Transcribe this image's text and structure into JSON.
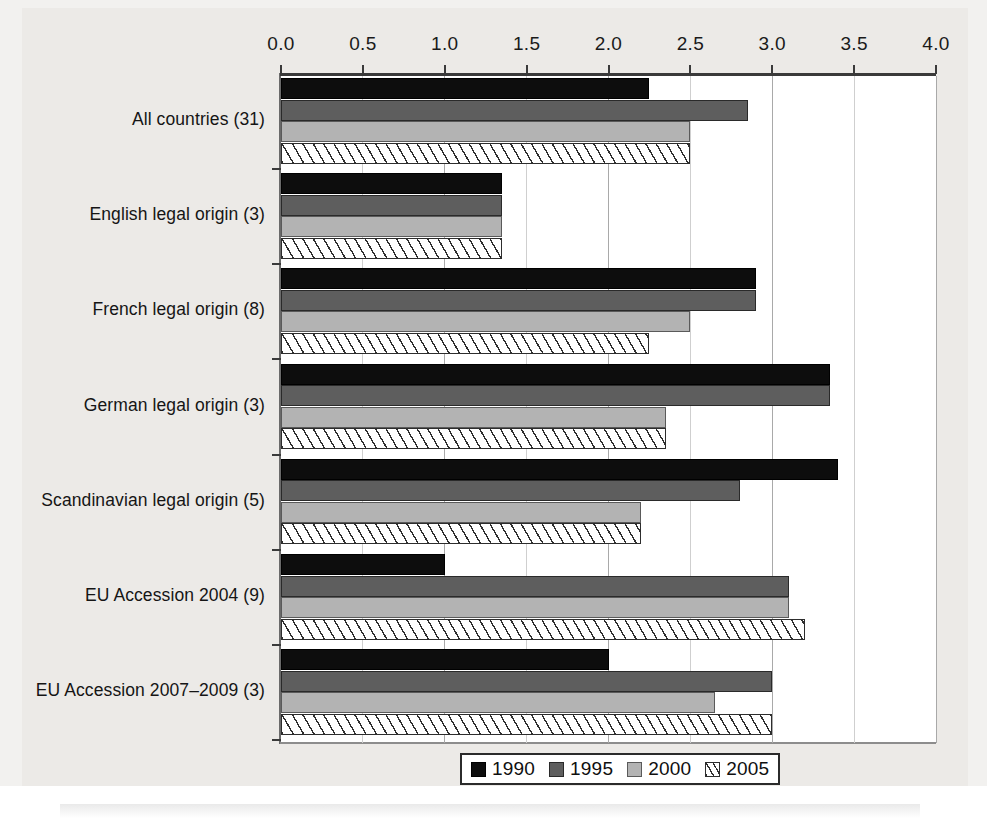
{
  "figure": {
    "background_color": "#eceae7",
    "plot_background_color": "#ffffff"
  },
  "chart_data": {
    "type": "bar",
    "orientation": "horizontal",
    "title": "",
    "subtitle": "",
    "xlabel": "",
    "ylabel": "",
    "xlim": [
      0.0,
      4.0
    ],
    "xticks": [
      "0.0",
      "0.5",
      "1.0",
      "1.5",
      "2.0",
      "2.5",
      "3.0",
      "3.5",
      "4.0"
    ],
    "xtick_values": [
      0.0,
      0.5,
      1.0,
      1.5,
      2.0,
      2.5,
      3.0,
      3.5,
      4.0
    ],
    "grid": true,
    "grid_axis": "x",
    "legend_position": "bottom-center",
    "categories": [
      "All countries (31)",
      "English legal origin (3)",
      "French legal origin (8)",
      "German legal origin (3)",
      "Scandinavian legal origin (5)",
      "EU Accession 2004 (9)",
      "EU Accession 2007–2009 (3)"
    ],
    "series": [
      {
        "name": "1990",
        "color": "#0d0d0d",
        "pattern": "solid",
        "values": [
          2.25,
          1.35,
          2.9,
          3.35,
          3.4,
          1.0,
          2.0
        ]
      },
      {
        "name": "1995",
        "color": "#5e5e5e",
        "pattern": "solid",
        "values": [
          2.85,
          1.35,
          2.9,
          3.35,
          2.8,
          3.1,
          3.0
        ]
      },
      {
        "name": "2000",
        "color": "#b3b3b3",
        "pattern": "solid",
        "values": [
          2.5,
          1.35,
          2.5,
          2.35,
          2.2,
          3.1,
          2.65
        ]
      },
      {
        "name": "2005",
        "color": "#ffffff",
        "pattern": "diagonal-hatch",
        "values": [
          2.5,
          1.35,
          2.25,
          2.35,
          2.2,
          3.2,
          3.0
        ]
      }
    ]
  },
  "legend": {
    "items": [
      {
        "label": "1990",
        "key": "y1990"
      },
      {
        "label": "1995",
        "key": "y1995"
      },
      {
        "label": "2000",
        "key": "y2000"
      },
      {
        "label": "2005",
        "key": "y2005"
      }
    ]
  }
}
